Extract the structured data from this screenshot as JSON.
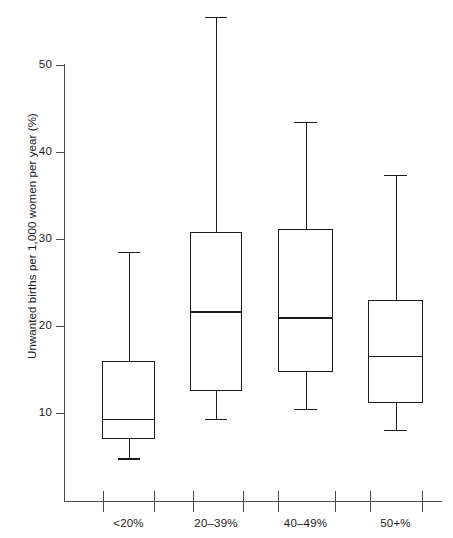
{
  "chart_data": {
    "type": "box",
    "title": "",
    "xlabel": "",
    "ylabel": "Unwanted births per 1,000 women per year (%)",
    "categories": [
      "<20%",
      "20–39%",
      "40–49%",
      "50+%"
    ],
    "ylim": [
      0,
      55
    ],
    "y_ticks": [
      10,
      20,
      30,
      40,
      50
    ],
    "y_tick_labels": [
      "10",
      "20",
      "30",
      "40",
      "50"
    ],
    "grid": false,
    "legend": null,
    "boxes": [
      {
        "category": "<20%",
        "whisker_low": 4.8,
        "q1": 7.0,
        "median": 9.3,
        "q3": 16.0,
        "whisker_high": 28.5
      },
      {
        "category": "20–39%",
        "whisker_low": 9.3,
        "q1": 12.5,
        "median": 21.7,
        "q3": 30.8,
        "whisker_high": 55.5
      },
      {
        "category": "40–49%",
        "whisker_low": 10.5,
        "q1": 14.7,
        "median": 21.0,
        "q3": 31.2,
        "whisker_high": 43.5
      },
      {
        "category": "50+%",
        "whisker_low": 8.1,
        "q1": 11.2,
        "median": 16.6,
        "q3": 23.0,
        "whisker_high": 37.4
      }
    ]
  },
  "axes": {
    "y_axis_name": "y-axis",
    "x_axis_name": "x-axis"
  },
  "colors": {
    "line": "#1a1a1a",
    "axis": "#4a4a4a",
    "background": "#ffffff"
  }
}
